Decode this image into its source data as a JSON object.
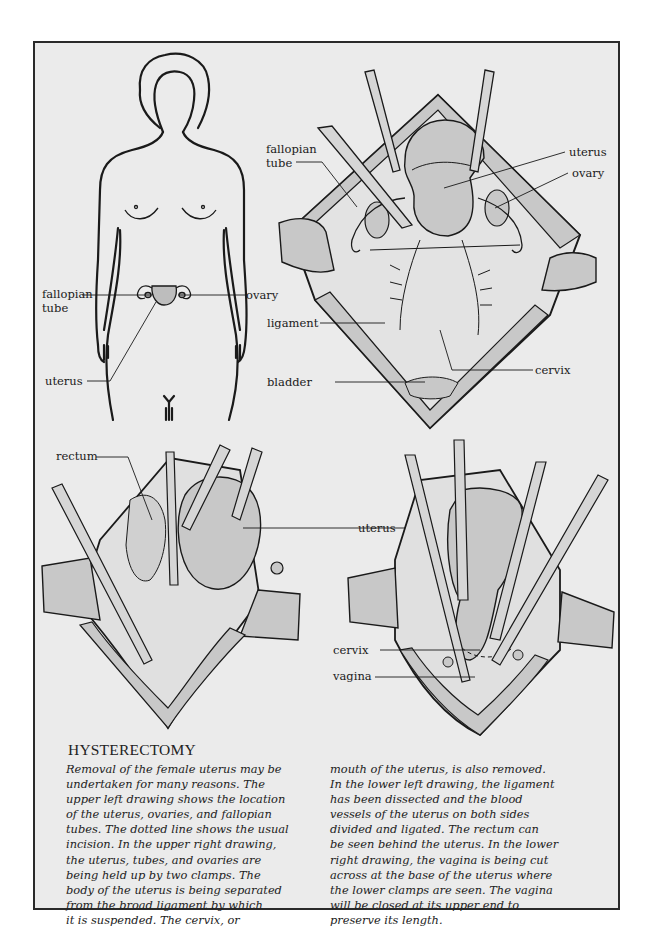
{
  "figure": {
    "panels": {
      "upper_left": {
        "description": "female body outline showing location of reproductive organs",
        "labels": {
          "fallopian_tube_line1": "fallopian",
          "fallopian_tube_line2": "tube",
          "ovary": "ovary",
          "uterus": "uterus"
        }
      },
      "upper_right": {
        "description": "uterus, tubes and ovaries held up by two clamps",
        "labels": {
          "fallopian_tube_line1": "fallopian",
          "fallopian_tube_line2": "tube",
          "uterus": "uterus",
          "ovary": "ovary",
          "ligament": "ligament",
          "cervix": "cervix",
          "bladder": "bladder"
        }
      },
      "lower_left": {
        "description": "ligament dissected, rectum seen behind uterus",
        "labels": {
          "rectum": "rectum",
          "uterus": "uterus"
        }
      },
      "lower_right": {
        "description": "vagina being cut across at base of uterus",
        "labels": {
          "cervix": "cervix",
          "vagina": "vagina"
        }
      }
    },
    "colors": {
      "page_background": "#ebebeb",
      "tissue_fill": "#c8c8c8",
      "outline": "#1a1a1a"
    }
  },
  "caption": {
    "title": "HYSTERECTOMY",
    "column1": [
      "Removal of the female uterus may be",
      "undertaken for many reasons. The",
      "upper left drawing shows the location",
      "of the uterus, ovaries, and fallopian",
      "tubes. The dotted line shows the usual",
      "incision. In the upper right drawing,",
      "the uterus, tubes, and ovaries are",
      "being held up by two clamps. The",
      "body of the uterus is being separated",
      "from the broad ligament by which",
      "it is suspended. The cervix, or"
    ],
    "column2": [
      "mouth of the uterus, is also removed.",
      "In the lower left drawing, the ligament",
      "has been dissected and the blood",
      "vessels of the uterus on both sides",
      "divided and ligated. The rectum can",
      "be seen behind the uterus. In the lower",
      "right drawing, the vagina is being cut",
      "across at the base of the uterus where",
      "the lower clamps are seen. The vagina",
      "will be closed at its upper end to",
      "preserve its length."
    ]
  }
}
